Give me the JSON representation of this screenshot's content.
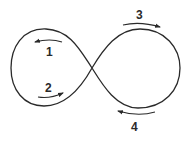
{
  "diagram": {
    "type": "figure-eight-loop",
    "stroke_color": "#2a2a2a",
    "background": "#ffffff",
    "labels": [
      {
        "id": "1",
        "text": "1",
        "direction": "left",
        "loop": "left",
        "position": "upper"
      },
      {
        "id": "2",
        "text": "2",
        "direction": "right",
        "loop": "left",
        "position": "lower"
      },
      {
        "id": "3",
        "text": "3",
        "direction": "right",
        "loop": "right",
        "position": "upper"
      },
      {
        "id": "4",
        "text": "4",
        "direction": "left",
        "loop": "right",
        "position": "lower"
      }
    ]
  }
}
